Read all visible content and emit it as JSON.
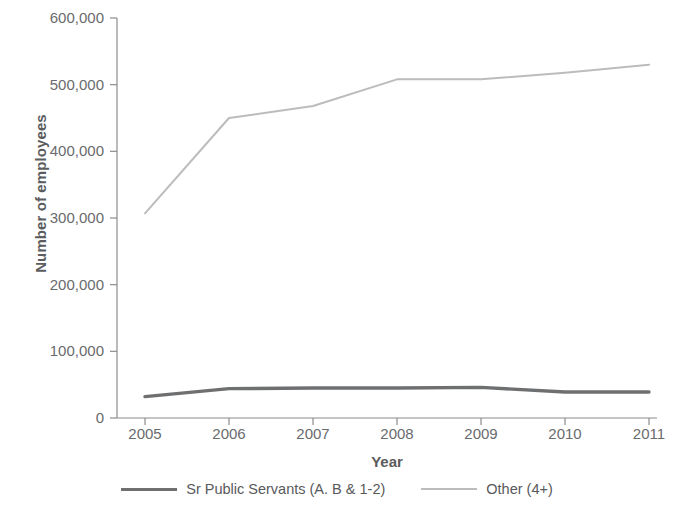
{
  "chart_data": {
    "type": "line",
    "title": "",
    "subtitle": "",
    "xlabel": "Year",
    "ylabel": "Number of employees",
    "categories": [
      "2005",
      "2006",
      "2007",
      "2008",
      "2009",
      "2010",
      "2011"
    ],
    "x": [
      2005,
      2006,
      2007,
      2008,
      2009,
      2010,
      2011
    ],
    "series": [
      {
        "name": "Sr Public Servants (A. B & 1-2)",
        "color": "#6e6f71",
        "values": [
          32000,
          44000,
          45000,
          45000,
          46000,
          39000,
          39000
        ]
      },
      {
        "name": "Other (4+)",
        "color": "#bcbcbc",
        "values": [
          307000,
          450000,
          468000,
          508000,
          508000,
          518000,
          530000
        ]
      }
    ],
    "ylim": [
      0,
      600000
    ],
    "ytick_values": [
      0,
      100000,
      200000,
      300000,
      400000,
      500000,
      600000
    ],
    "ytick_labels": [
      "0",
      "100,000",
      "200,000",
      "300,000",
      "400,000",
      "500,000",
      "600,000"
    ],
    "grid": false,
    "legend_position": "bottom"
  },
  "legend": {
    "entries": [
      {
        "label": "Sr Public Servants (A. B & 1-2)",
        "color": "#6e6f71",
        "thickness": 3.4
      },
      {
        "label": "Other (4+)",
        "color": "#bcbcbc",
        "thickness": 2.0
      }
    ]
  },
  "axes": {
    "axis_color": "#8b8c8e",
    "label_color": "#6a6b6d",
    "title_color": "#5b5c5e"
  }
}
